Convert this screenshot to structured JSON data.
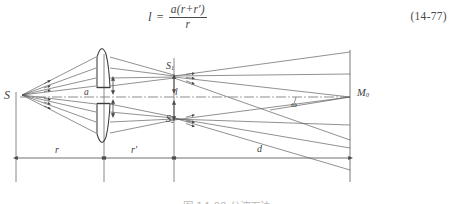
{
  "equation": {
    "lhs": "l",
    "equals": "=",
    "numerator": "a(r+r′)",
    "denominator": "r",
    "number": "(14-77)"
  },
  "figure": {
    "labels": {
      "source": "S",
      "image_upper": "S",
      "image_upper_sub": "1",
      "image_lower": "S",
      "image_lower_sub": "2",
      "screen_point": "M",
      "screen_point_sub": "0",
      "lens_separation": "a",
      "image_separation": "l",
      "angle": "ω",
      "dim_r": "r",
      "dim_r_prime": "r′",
      "dim_d": "d"
    },
    "colors": {
      "ray": "#555555",
      "axis": "#6a6a6a",
      "outline": "#3c3c3c",
      "dimension": "#4d4d4d"
    }
  },
  "caption": {
    "text": "图 14-00  分波面法"
  }
}
